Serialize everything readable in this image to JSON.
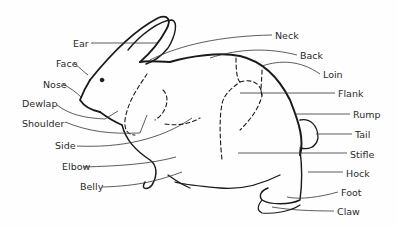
{
  "diagram": {
    "labels": [
      {
        "id": "ear",
        "text": "Ear",
        "x": 73,
        "y": 39
      },
      {
        "id": "face",
        "text": "Face",
        "x": 56,
        "y": 59
      },
      {
        "id": "nose",
        "text": "Nose",
        "x": 43,
        "y": 80
      },
      {
        "id": "dewlap",
        "text": "Dewlap",
        "x": 22,
        "y": 99
      },
      {
        "id": "shoulder",
        "text": "Shoulder",
        "x": 22,
        "y": 119
      },
      {
        "id": "side",
        "text": "Side",
        "x": 55,
        "y": 141
      },
      {
        "id": "elbow",
        "text": "Elbow",
        "x": 62,
        "y": 162
      },
      {
        "id": "belly",
        "text": "Belly",
        "x": 80,
        "y": 182
      },
      {
        "id": "neck",
        "text": "Neck",
        "x": 275,
        "y": 31
      },
      {
        "id": "back",
        "text": "Back",
        "x": 300,
        "y": 51
      },
      {
        "id": "loin",
        "text": "Loin",
        "x": 323,
        "y": 70
      },
      {
        "id": "flank",
        "text": "Flank",
        "x": 338,
        "y": 89
      },
      {
        "id": "rump",
        "text": "Rump",
        "x": 353,
        "y": 110
      },
      {
        "id": "tail",
        "text": "Tail",
        "x": 355,
        "y": 130
      },
      {
        "id": "stifle",
        "text": "Stifle",
        "x": 350,
        "y": 150
      },
      {
        "id": "hock",
        "text": "Hock",
        "x": 346,
        "y": 169
      },
      {
        "id": "foot",
        "text": "Foot",
        "x": 341,
        "y": 188
      },
      {
        "id": "claw",
        "text": "Claw",
        "x": 337,
        "y": 207
      }
    ]
  }
}
